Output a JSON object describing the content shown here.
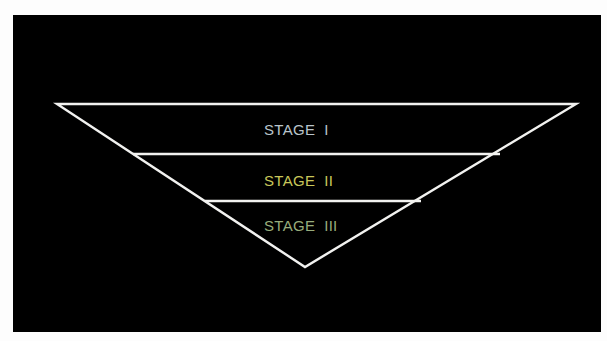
{
  "diagram": {
    "type": "inverted-funnel",
    "background": "#000000",
    "line_color": "#f2f2f0",
    "stages": [
      {
        "label": "STAGE  I",
        "color": "#b9c4cb"
      },
      {
        "label": "STAGE  II",
        "color": "#c9c75a"
      },
      {
        "label": "STAGE  III",
        "color": "#98ad7c"
      }
    ]
  }
}
